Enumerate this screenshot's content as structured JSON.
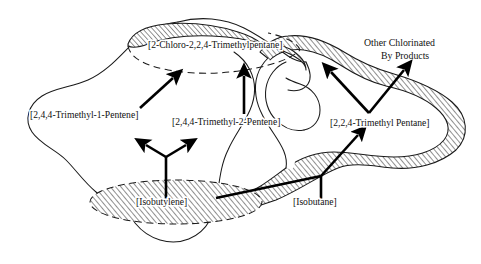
{
  "diagram": {
    "background_color": "#ffffff",
    "ink_color": "#1a1a1a",
    "canvas": {
      "width": 481,
      "height": 264
    }
  },
  "labels": {
    "chloro_trimethylpentane": "[2-Chloro-2,2,4-Trimethylpentane]",
    "trimethyl_1_pentene": "[2,4,4-Trimethyl-1-Pentene]",
    "trimethyl_2_pentene": "[2,4,4-Trimethyl-2-Pentene]",
    "trimethyl_pentane": "[2,2,4-Trimethyl Pentane]",
    "isobutylene": "[Isobutylene]",
    "isobutane": "[Isobutane]",
    "byproducts_line1": "Other Chlorinated",
    "byproducts_line2": "By Products"
  },
  "regions": [
    {
      "name": "chloro-product-region",
      "label_ref": "chloro_trimethylpentane",
      "fill": "hatched-partial",
      "border": "dashed-and-solid"
    },
    {
      "name": "olefin-region",
      "label_ref": "trimethyl_1_pentene",
      "fill": "white",
      "border": "solid-thin"
    },
    {
      "name": "trimethylpentane-region",
      "label_ref": "trimethyl_pentane",
      "fill": "hatched",
      "border": "solid-thin"
    },
    {
      "name": "isobutylene-region",
      "label_ref": "isobutylene",
      "fill": "hatched",
      "border": "dashed"
    }
  ],
  "arrows": [
    {
      "name": "isobutylene-to-1-pentene",
      "from": "isobutylene",
      "to": "trimethyl_1_pentene"
    },
    {
      "name": "isobutylene-to-2-pentene",
      "from": "isobutylene",
      "to": "trimethyl_2_pentene"
    },
    {
      "name": "pentene1-to-chloro",
      "from": "trimethyl_1_pentene",
      "to": "chloro_trimethylpentane"
    },
    {
      "name": "pentene2-to-chloro",
      "from": "trimethyl_2_pentene",
      "to": "chloro_trimethylpentane"
    },
    {
      "name": "isobutane-to-trimethylpentane",
      "from": "isobutane",
      "to": "trimethyl_pentane"
    },
    {
      "name": "isobutylene-to-isobutane-junction",
      "from": "isobutylene",
      "to": "isobutane"
    },
    {
      "name": "trimethylpentane-to-chloro",
      "from": "trimethyl_pentane",
      "to": "chloro_trimethylpentane"
    },
    {
      "name": "trimethylpentane-to-byproducts",
      "from": "trimethyl_pentane",
      "to": "byproducts"
    }
  ]
}
